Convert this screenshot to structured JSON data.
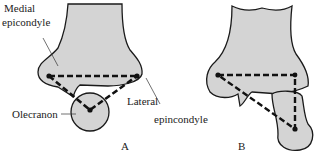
{
  "diagram": {
    "colors": {
      "bone_fill": "#d4d4d4",
      "outline": "#1a1a1a",
      "dash": "#111111",
      "background": "#ffffff"
    },
    "panels": [
      {
        "id": "A",
        "caption": "A",
        "description": "Normal elbow: isosceles triangle formed by medial epicondyle, lateral epicondyle and olecranon",
        "labels": {
          "medial_line1": "Medial",
          "medial_line2": "epicondyle",
          "lateral_line1": "Lateral",
          "lateral_line2": "epincondyle",
          "olecranon": "Olecranon"
        }
      },
      {
        "id": "B",
        "caption": "B",
        "description": "Dislocated elbow: triangle relationship disturbed, olecranon displaced posteriorly/downward"
      }
    ]
  }
}
